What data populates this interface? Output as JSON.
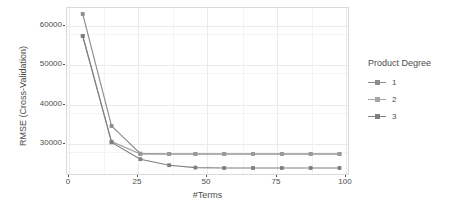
{
  "chart_data": {
    "type": "line",
    "title": "",
    "xlabel": "#Terms",
    "ylabel": "RMSE (Cross-Validation)",
    "xlim": [
      -4,
      104
    ],
    "ylim": [
      22000,
      64000
    ],
    "xticks": [
      0,
      25,
      50,
      75,
      100
    ],
    "xticklabels": [
      "0",
      "25",
      "50",
      "75",
      "100"
    ],
    "yticks": [
      30000,
      40000,
      50000,
      60000
    ],
    "yticklabels": [
      "30000",
      "40000",
      "50000",
      "60000"
    ],
    "grid": true,
    "legend_position": "right",
    "legend_title": "Product Degree",
    "x": [
      2,
      13,
      24,
      35,
      45,
      56,
      67,
      78,
      89,
      100
    ],
    "series": [
      {
        "name": "1",
        "color": "#8c8c8c",
        "values": [
          62500,
          34500,
          27600,
          27500,
          27500,
          27500,
          27500,
          27500,
          27500,
          27500
        ]
      },
      {
        "name": "2",
        "color": "#999999",
        "values": [
          57000,
          30600,
          27500,
          27500,
          27500,
          27500,
          27500,
          27500,
          27500,
          27500
        ]
      },
      {
        "name": "3",
        "color": "#7f7f7f",
        "values": [
          57000,
          30400,
          26200,
          24700,
          24100,
          24000,
          24000,
          24000,
          24000,
          24000
        ]
      }
    ]
  },
  "legend": {
    "title": "Product Degree",
    "items": [
      {
        "label": "1",
        "color": "#8c8c8c"
      },
      {
        "label": "2",
        "color": "#a6a6a6"
      },
      {
        "label": "3",
        "color": "#7f7f7f"
      }
    ]
  },
  "axes": {
    "x_label": "#Terms",
    "y_label": "RMSE (Cross-Validation)",
    "x_ticks": [
      "0",
      "25",
      "50",
      "75",
      "100"
    ],
    "y_ticks": [
      "30000",
      "40000",
      "50000",
      "60000"
    ]
  },
  "colors": {
    "panel_background": "#ffffff",
    "panel_border": "#d9d9d9",
    "gridline_major": "#ebebeb",
    "gridline_minor": "#f4f4f4",
    "text": "#4d4d4d"
  }
}
